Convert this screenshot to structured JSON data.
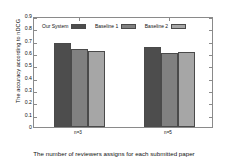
{
  "chart_data": {
    "type": "bar",
    "title": "",
    "xlabel": "The number of reviewers assigns for each submitted paper",
    "ylabel": "The accuracy according to nDCG",
    "categories": [
      "n=3",
      "n=5"
    ],
    "series": [
      {
        "name": "Our System",
        "values": [
          0.68,
          0.65
        ],
        "color": "#4d4d4d"
      },
      {
        "name": "Baseline 1",
        "values": [
          0.63,
          0.6
        ],
        "color": "#808080"
      },
      {
        "name": "Baseline 2",
        "values": [
          0.62,
          0.61
        ],
        "color": "#a6a6a6"
      }
    ],
    "ylim": [
      0,
      0.9
    ],
    "yticks": [
      "0",
      "0.1",
      "0.2",
      "0.3",
      "0.4",
      "0.5",
      "0.6",
      "0.7",
      "0.8",
      "0.9"
    ],
    "ytick_values": [
      0,
      0.1,
      0.2,
      0.3,
      0.4,
      0.5,
      0.6,
      0.7,
      0.8,
      0.9
    ],
    "grid": false,
    "legend_position": "top-left-inside",
    "axis_color": "#8a8a8a",
    "background": "#ffffff"
  }
}
